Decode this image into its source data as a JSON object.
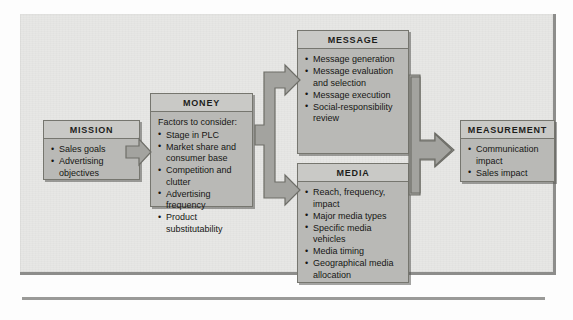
{
  "diagram": {
    "colors": {
      "page_background": "#e7e7e5",
      "box_fill": "#b9b9b6",
      "box_header_fill": "#c9c9c6",
      "box_border": "#76766f",
      "arrow_fill": "#a3a39f",
      "arrow_border": "#6e6e68",
      "text": "#161614"
    },
    "bleed_text": "bleed-through text from reverse page",
    "boxes": [
      {
        "id": "mission",
        "title": "MISSION",
        "intro": "",
        "items": [
          "Sales goals",
          "Advertising objectives"
        ]
      },
      {
        "id": "money",
        "title": "MONEY",
        "intro": "Factors to consider:",
        "items": [
          "Stage in PLC",
          "Market share and consumer base",
          "Competition and clutter",
          "Advertising frequency",
          "Product substitutability"
        ]
      },
      {
        "id": "message",
        "title": "MESSAGE",
        "intro": "",
        "items": [
          "Message generation",
          "Message evaluation and selection",
          "Message execution",
          "Social-responsibility review"
        ]
      },
      {
        "id": "media",
        "title": "MEDIA",
        "intro": "",
        "items": [
          "Reach, frequency, impact",
          "Major media types",
          "Specific media vehicles",
          "Media timing",
          "Geographical media allocation"
        ]
      },
      {
        "id": "measurement",
        "title": "MEASUREMENT",
        "intro": "",
        "items": [
          "Communication impact",
          "Sales impact"
        ]
      }
    ],
    "arrows": [
      {
        "id": "mission-to-money",
        "kind": "single-right"
      },
      {
        "id": "money-to-message-media",
        "kind": "split-right"
      },
      {
        "id": "message-media-to-measurement",
        "kind": "merge-right"
      }
    ]
  }
}
